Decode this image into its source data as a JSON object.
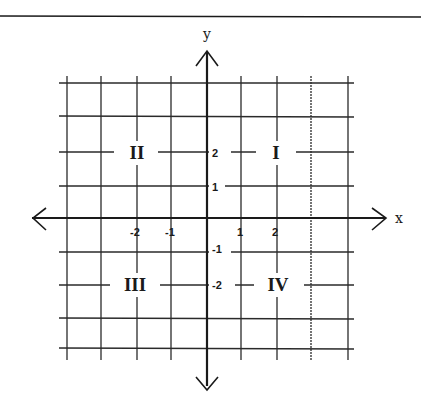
{
  "diagram": {
    "axes": {
      "x_label": "x",
      "y_label": "y"
    },
    "x_ticks": [
      {
        "label": "-2",
        "value": -2
      },
      {
        "label": "-1",
        "value": -1
      },
      {
        "label": "1",
        "value": 1
      },
      {
        "label": "2",
        "value": 2
      }
    ],
    "y_ticks": [
      {
        "label": "2",
        "value": 2
      },
      {
        "label": "1",
        "value": 1
      },
      {
        "label": "-1",
        "value": -1
      },
      {
        "label": "-2",
        "value": -2
      }
    ],
    "quadrants": [
      {
        "label": "I",
        "position": "upper-right"
      },
      {
        "label": "II",
        "position": "upper-left"
      },
      {
        "label": "III",
        "position": "lower-left"
      },
      {
        "label": "IV",
        "position": "lower-right"
      }
    ],
    "grid": {
      "columns": 8,
      "rows": 8,
      "range": [
        -4,
        4
      ]
    },
    "colors": {
      "line": "#2a2a2a",
      "background": "#ffffff"
    }
  }
}
